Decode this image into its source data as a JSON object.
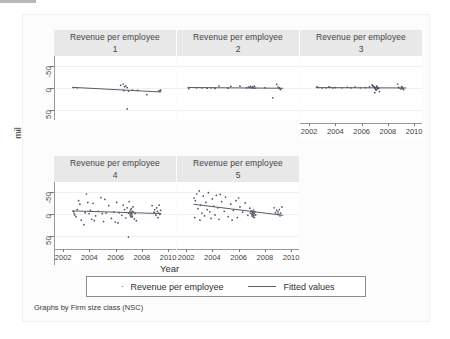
{
  "figure": {
    "background": "#ffffff",
    "panel_title_bg": "#e8e8e8",
    "marker_color": "#4a4f5c",
    "line_color": "#585d69",
    "axis_color": "#9a9a9a"
  },
  "axes": {
    "ylabel": "mil",
    "xlabel": "Year",
    "yticks": [
      "50",
      "0",
      "-50"
    ],
    "ytick_values": [
      50,
      0,
      -50
    ],
    "xticks": [
      "2002",
      "2004",
      "2006",
      "2008",
      "2010"
    ],
    "xtick_values": [
      2002,
      2004,
      2006,
      2008,
      2010
    ],
    "xlim": [
      2001.3,
      2010.6
    ],
    "ylim": [
      -72,
      72
    ]
  },
  "legend": {
    "scatter_label": "Revenue per employee",
    "line_label": "Fitted values",
    "scatter_marker": "dot-marker-icon",
    "line_marker": "line-key-icon"
  },
  "caption": "Graphs by Firm size class (NSC)",
  "chart_data": {
    "type": "scatter",
    "title": "",
    "xlabel": "Year",
    "ylabel": "mil",
    "grid": true,
    "legend_position": "bottom",
    "xlim": [
      2001.3,
      2010.6
    ],
    "ylim": [
      -72,
      72
    ],
    "xticks": [
      2002,
      2004,
      2006,
      2008,
      2010
    ],
    "yticks": [
      -50,
      0,
      50
    ],
    "by_variable": "Firm size class (NSC)",
    "panels": [
      {
        "title": "Revenue per employee",
        "group": "1",
        "row": 0,
        "col": 0,
        "show_xaxis": false,
        "show_yaxis": true,
        "points": [
          [
            2002.7,
            1.0
          ],
          [
            2003.0,
            0.5
          ],
          [
            2006.3,
            6.0
          ],
          [
            2006.5,
            9.0
          ],
          [
            2006.6,
            3.0
          ],
          [
            2006.7,
            5.0
          ],
          [
            2006.8,
            1.0
          ],
          [
            2006.55,
            -6.0
          ],
          [
            2006.9,
            -7.0
          ],
          [
            2007.2,
            -5.0
          ],
          [
            2007.6,
            -5.5
          ],
          [
            2008.3,
            -15.0
          ],
          [
            2009.2,
            -7.0
          ],
          [
            2009.3,
            -6.0
          ],
          [
            2009.35,
            -5.0
          ],
          [
            2006.8,
            -47.0
          ]
        ],
        "fit_line": {
          "x": [
            2002.6,
            2009.4
          ],
          "y": [
            1.5,
            -9.0
          ],
          "slope": -1.54
        }
      },
      {
        "title": "Revenue per employee",
        "group": "2",
        "row": 0,
        "col": 1,
        "show_xaxis": false,
        "show_yaxis": false,
        "points": [
          [
            2002.2,
            -1.5
          ],
          [
            2002.8,
            0.5
          ],
          [
            2003.2,
            0.0
          ],
          [
            2003.6,
            -0.5
          ],
          [
            2003.9,
            0.5
          ],
          [
            2004.2,
            -1.0
          ],
          [
            2004.5,
            4.5
          ],
          [
            2005.2,
            -0.5
          ],
          [
            2005.4,
            3.5
          ],
          [
            2006.1,
            4.0
          ],
          [
            2006.6,
            0.5
          ],
          [
            2006.75,
            2.0
          ],
          [
            2006.85,
            1.0
          ],
          [
            2006.9,
            3.5
          ],
          [
            2007.0,
            0.5
          ],
          [
            2007.05,
            2.5
          ],
          [
            2007.1,
            1.5
          ],
          [
            2007.15,
            -0.5
          ],
          [
            2007.2,
            4.0
          ],
          [
            2007.3,
            0.0
          ],
          [
            2008.0,
            0.5
          ],
          [
            2008.9,
            8.0
          ],
          [
            2009.0,
            2.0
          ],
          [
            2009.1,
            0.5
          ],
          [
            2009.15,
            -2.0
          ],
          [
            2009.2,
            -3.5
          ],
          [
            2008.6,
            -22.0
          ]
        ],
        "fit_line": {
          "x": [
            2002.1,
            2009.4
          ],
          "y": [
            1.2,
            -0.6
          ],
          "slope": -0.25
        }
      },
      {
        "title": "Revenue per employee",
        "group": "3",
        "row": 0,
        "col": 2,
        "show_xaxis": true,
        "show_yaxis": false,
        "points": [
          [
            2002.6,
            2.5
          ],
          [
            2002.7,
            1.0
          ],
          [
            2003.0,
            0.0
          ],
          [
            2003.3,
            0.5
          ],
          [
            2003.5,
            2.5
          ],
          [
            2003.6,
            1.5
          ],
          [
            2003.8,
            0.0
          ],
          [
            2004.0,
            1.0
          ],
          [
            2004.5,
            0.5
          ],
          [
            2004.9,
            1.5
          ],
          [
            2005.2,
            0.5
          ],
          [
            2005.5,
            2.0
          ],
          [
            2005.9,
            0.5
          ],
          [
            2006.3,
            1.0
          ],
          [
            2006.6,
            2.5
          ],
          [
            2006.8,
            7.0
          ],
          [
            2006.85,
            5.0
          ],
          [
            2006.9,
            3.5
          ],
          [
            2006.95,
            2.0
          ],
          [
            2007.0,
            1.0
          ],
          [
            2007.02,
            0.0
          ],
          [
            2007.05,
            -1.5
          ],
          [
            2007.08,
            -3.0
          ],
          [
            2007.1,
            -5.0
          ],
          [
            2007.12,
            2.5
          ],
          [
            2007.15,
            4.0
          ],
          [
            2007.18,
            -2.0
          ],
          [
            2007.2,
            1.5
          ],
          [
            2007.25,
            0.5
          ],
          [
            2007.3,
            -1.0
          ],
          [
            2007.0,
            -10.5
          ],
          [
            2007.35,
            -8.0
          ],
          [
            2008.8,
            1.5
          ],
          [
            2008.9,
            0.0
          ],
          [
            2009.0,
            -2.0
          ],
          [
            2009.05,
            3.0
          ],
          [
            2009.1,
            1.0
          ],
          [
            2009.15,
            -1.5
          ],
          [
            2009.2,
            -3.5
          ],
          [
            2008.75,
            9.0
          ]
        ],
        "fit_line": {
          "x": [
            2002.5,
            2009.4
          ],
          "y": [
            0.9,
            0.1
          ],
          "slope": -0.12
        }
      },
      {
        "title": "Revenue per employee",
        "group": "4",
        "row": 1,
        "col": 0,
        "show_xaxis": true,
        "show_yaxis": true,
        "points": [
          [
            2002.7,
            6.0
          ],
          [
            2002.75,
            2.0
          ],
          [
            2002.8,
            -2.0
          ],
          [
            2002.9,
            -6.0
          ],
          [
            2003.0,
            10.0
          ],
          [
            2003.1,
            30.0
          ],
          [
            2003.2,
            22.0
          ],
          [
            2003.3,
            -14.0
          ],
          [
            2003.5,
            -24.0
          ],
          [
            2003.6,
            3.0
          ],
          [
            2003.7,
            45.0
          ],
          [
            2003.8,
            26.0
          ],
          [
            2003.9,
            1.0
          ],
          [
            2004.0,
            8.0
          ],
          [
            2004.2,
            24.0
          ],
          [
            2004.4,
            -4.0
          ],
          [
            2004.6,
            6.0
          ],
          [
            2004.8,
            37.0
          ],
          [
            2004.9,
            1.0
          ],
          [
            2005.0,
            -17.0
          ],
          [
            2005.2,
            2.0
          ],
          [
            2005.4,
            19.0
          ],
          [
            2005.6,
            -10.0
          ],
          [
            2005.8,
            5.0
          ],
          [
            2005.9,
            -18.0
          ],
          [
            2006.0,
            26.0
          ],
          [
            2006.2,
            3.0
          ],
          [
            2006.4,
            -3.0
          ],
          [
            2006.5,
            20.0
          ],
          [
            2006.6,
            10.0
          ],
          [
            2006.7,
            -9.0
          ],
          [
            2006.8,
            14.0
          ],
          [
            2006.9,
            2.0
          ],
          [
            2006.95,
            28.0
          ],
          [
            2007.0,
            5.0
          ],
          [
            2007.02,
            0.0
          ],
          [
            2007.04,
            -4.0
          ],
          [
            2007.06,
            9.0
          ],
          [
            2007.08,
            3.0
          ],
          [
            2007.1,
            -7.0
          ],
          [
            2007.12,
            12.0
          ],
          [
            2007.14,
            1.0
          ],
          [
            2007.16,
            -2.0
          ],
          [
            2007.18,
            6.0
          ],
          [
            2007.2,
            -6.0
          ],
          [
            2007.25,
            16.0
          ],
          [
            2007.3,
            4.0
          ],
          [
            2007.35,
            -11.0
          ],
          [
            2007.4,
            1.0
          ],
          [
            2007.5,
            -15.0
          ],
          [
            2006.9,
            -52.0
          ],
          [
            2008.7,
            19.0
          ],
          [
            2008.85,
            4.0
          ],
          [
            2008.9,
            10.0
          ],
          [
            2008.95,
            1.0
          ],
          [
            2009.0,
            -3.0
          ],
          [
            2009.05,
            14.0
          ],
          [
            2009.1,
            6.0
          ],
          [
            2009.15,
            -8.0
          ],
          [
            2009.2,
            2.0
          ],
          [
            2009.25,
            20.0
          ],
          [
            2009.3,
            -1.0
          ],
          [
            2009.35,
            8.0
          ],
          [
            2004.3,
            -15.0
          ],
          [
            2005.1,
            33.0
          ],
          [
            2004.1,
            -12.0
          ],
          [
            2006.1,
            -20.0
          ]
        ],
        "fit_line": {
          "x": [
            2002.6,
            2009.4
          ],
          "y": [
            7.0,
            1.0
          ],
          "slope": -0.88
        }
      },
      {
        "title": "Revenue per employee",
        "group": "5",
        "row": 1,
        "col": 1,
        "show_xaxis": true,
        "show_yaxis": false,
        "points": [
          [
            2002.6,
            36.0
          ],
          [
            2002.7,
            30.0
          ],
          [
            2002.8,
            45.0
          ],
          [
            2002.9,
            12.0
          ],
          [
            2003.0,
            52.0
          ],
          [
            2003.1,
            20.0
          ],
          [
            2003.2,
            2.0
          ],
          [
            2003.3,
            40.0
          ],
          [
            2003.4,
            -4.0
          ],
          [
            2003.5,
            26.0
          ],
          [
            2003.6,
            10.0
          ],
          [
            2003.7,
            48.0
          ],
          [
            2003.8,
            5.0
          ],
          [
            2003.9,
            -10.0
          ],
          [
            2004.0,
            34.0
          ],
          [
            2004.1,
            18.0
          ],
          [
            2004.2,
            -2.0
          ],
          [
            2004.3,
            42.0
          ],
          [
            2004.4,
            14.0
          ],
          [
            2004.5,
            -12.0
          ],
          [
            2004.7,
            28.0
          ],
          [
            2004.9,
            6.0
          ],
          [
            2005.0,
            38.0
          ],
          [
            2005.2,
            -6.0
          ],
          [
            2005.4,
            22.0
          ],
          [
            2005.6,
            8.0
          ],
          [
            2005.8,
            30.0
          ],
          [
            2005.9,
            -8.0
          ],
          [
            2006.1,
            16.0
          ],
          [
            2006.3,
            4.0
          ],
          [
            2006.5,
            25.0
          ],
          [
            2006.7,
            -3.0
          ],
          [
            2006.85,
            13.0
          ],
          [
            2006.9,
            2.0
          ],
          [
            2006.95,
            7.0
          ],
          [
            2007.0,
            0.0
          ],
          [
            2007.02,
            -4.0
          ],
          [
            2007.04,
            4.0
          ],
          [
            2007.06,
            -1.0
          ],
          [
            2007.08,
            6.0
          ],
          [
            2007.1,
            -6.0
          ],
          [
            2007.12,
            2.0
          ],
          [
            2007.14,
            9.0
          ],
          [
            2007.16,
            -3.0
          ],
          [
            2007.18,
            1.0
          ],
          [
            2007.2,
            -8.0
          ],
          [
            2007.25,
            5.0
          ],
          [
            2007.3,
            -2.0
          ],
          [
            2008.7,
            14.0
          ],
          [
            2008.8,
            3.0
          ],
          [
            2008.9,
            8.0
          ],
          [
            2008.95,
            -1.0
          ],
          [
            2009.0,
            5.0
          ],
          [
            2009.05,
            0.0
          ],
          [
            2009.1,
            10.0
          ],
          [
            2009.15,
            -4.0
          ],
          [
            2009.2,
            2.0
          ],
          [
            2009.3,
            16.0
          ],
          [
            2002.65,
            -8.0
          ],
          [
            2003.05,
            -14.0
          ],
          [
            2004.6,
            44.0
          ],
          [
            2005.5,
            -14.0
          ],
          [
            2006.0,
            36.0
          ]
        ],
        "fit_line": {
          "x": [
            2002.55,
            2009.4
          ],
          "y": [
            22.0,
            -3.0
          ],
          "slope": -3.65
        }
      }
    ]
  }
}
